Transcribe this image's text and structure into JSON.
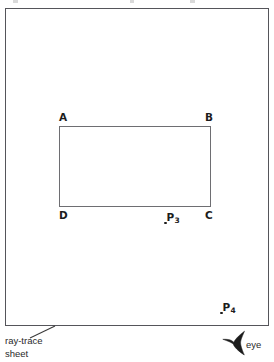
{
  "figure": {
    "background_color": "#ffffff",
    "sheet": {
      "name": "ray-trace sheet",
      "caption": "ray-trace\nsheet",
      "border_color": "#55555a"
    },
    "quad": {
      "stroke_color": "#6e6e72",
      "vertices": [
        {
          "id": "A",
          "label": "A",
          "position": "top-left"
        },
        {
          "id": "B",
          "label": "B",
          "position": "top-right"
        },
        {
          "id": "C",
          "label": "C",
          "position": "bottom-right"
        },
        {
          "id": "D",
          "label": "D",
          "position": "bottom-left"
        }
      ]
    },
    "points": [
      {
        "id": "P3",
        "label": "P",
        "subscript": "3"
      },
      {
        "id": "P4",
        "label": "P",
        "subscript": "4"
      }
    ],
    "observer": {
      "caption": "eye",
      "symbol": "eye-arrowhead",
      "color": "#1c1c1c"
    }
  }
}
